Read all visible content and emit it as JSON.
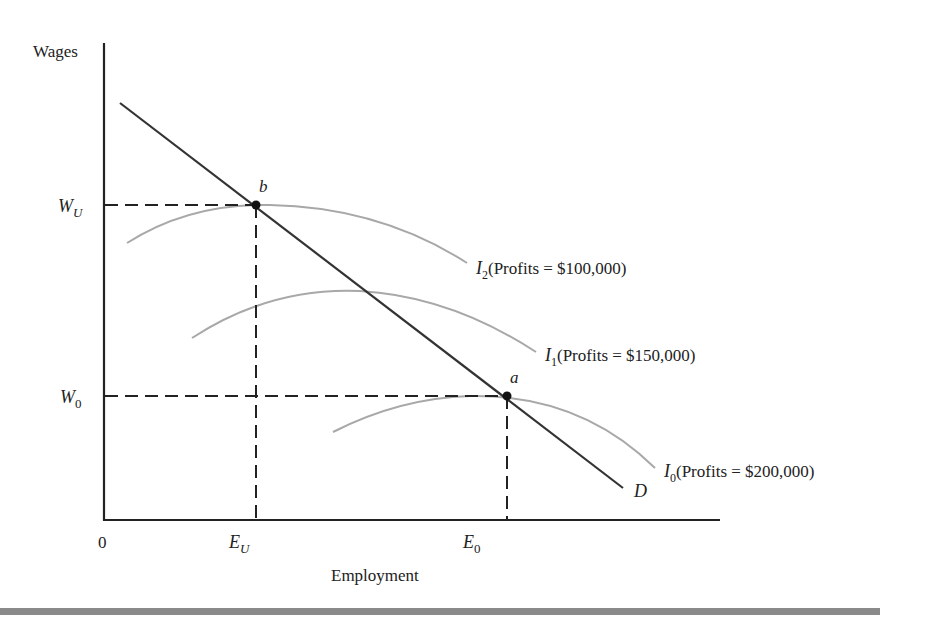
{
  "axes": {
    "y_label": "Wages",
    "x_label": "Employment",
    "origin_label": "0"
  },
  "y_ticks": [
    {
      "main": "W",
      "sub": "U",
      "name": "W_U"
    },
    {
      "main": "W",
      "sub": "0",
      "name": "W_0"
    }
  ],
  "x_ticks": [
    {
      "main": "E",
      "sub": "U",
      "name": "E_U"
    },
    {
      "main": "E",
      "sub": "0",
      "name": "E_0"
    }
  ],
  "points": {
    "b": "b",
    "a": "a"
  },
  "demand_label": "D",
  "curves": [
    {
      "main": "I",
      "sub": "2",
      "text": "(Profits = $100,000)"
    },
    {
      "main": "I",
      "sub": "1",
      "text": "(Profits = $150,000)"
    },
    {
      "main": "I",
      "sub": "0",
      "text": "(Profits = $200,000)"
    }
  ],
  "colors": {
    "axis": "#222222",
    "demand": "#333333",
    "isoprofit": "#a8a8a8",
    "bar": "#8a8a8a"
  }
}
